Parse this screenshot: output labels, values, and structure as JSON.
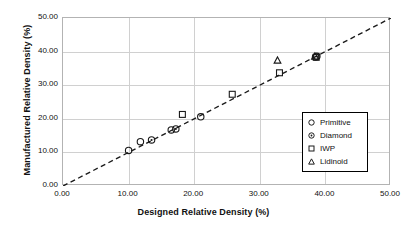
{
  "chart_data": {
    "type": "scatter",
    "title": "",
    "xlabel": "Designed Relative Density (%)",
    "ylabel": "Manufactured Relative Density (%)",
    "xlim": [
      0,
      50
    ],
    "ylim": [
      0,
      50
    ],
    "xticks": [
      "0.00",
      "10.00",
      "20.00",
      "30.00",
      "40.00",
      "50.00"
    ],
    "yticks": [
      "0.00",
      "10.00",
      "20.00",
      "30.00",
      "40.00",
      "50.00"
    ],
    "xtick_values": [
      0,
      10,
      20,
      30,
      40,
      50
    ],
    "ytick_values": [
      0,
      10,
      20,
      30,
      40,
      50
    ],
    "grid": true,
    "legend_position": "lower-right",
    "reference_line": {
      "name": "parity-line",
      "style": "dashed",
      "color": "#1a1a1a",
      "from": [
        0,
        0
      ],
      "to": [
        50,
        50
      ]
    },
    "series": [
      {
        "name": "Primitive",
        "marker": "circle",
        "color": "#1a1a1a",
        "points": [
          [
            10.0,
            10.6
          ],
          [
            11.8,
            13.2
          ],
          [
            16.5,
            16.7
          ],
          [
            21.0,
            20.6
          ],
          [
            38.5,
            38.4
          ]
        ]
      },
      {
        "name": "Diamond",
        "marker": "circle-dot",
        "color": "#1a1a1a",
        "points": [
          [
            13.5,
            13.7
          ],
          [
            17.2,
            17.0
          ],
          [
            38.7,
            38.6
          ]
        ]
      },
      {
        "name": "IWP",
        "marker": "square",
        "color": "#1a1a1a",
        "points": [
          [
            18.2,
            21.3
          ],
          [
            25.8,
            27.3
          ],
          [
            33.0,
            33.7
          ],
          [
            38.6,
            38.3
          ]
        ]
      },
      {
        "name": "Lidinoid",
        "marker": "triangle",
        "color": "#1a1a1a",
        "points": [
          [
            32.7,
            37.5
          ],
          [
            38.4,
            38.7
          ]
        ]
      }
    ]
  },
  "legend": {
    "items": [
      {
        "label": "Primitive",
        "marker": "circle"
      },
      {
        "label": "Diamond",
        "marker": "circle-dot"
      },
      {
        "label": "IWP",
        "marker": "square"
      },
      {
        "label": "Lidinoid",
        "marker": "triangle"
      }
    ]
  }
}
